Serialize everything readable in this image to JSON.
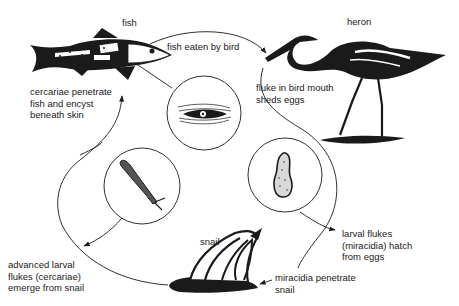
{
  "diagram": {
    "type": "life-cycle",
    "colors": {
      "ink": "#1a1a1a",
      "background": "#ffffff"
    },
    "hosts": {
      "fish": {
        "label": "fish"
      },
      "heron": {
        "label": "heron"
      },
      "snail": {
        "label": "snail"
      }
    },
    "stages": {
      "fish_eaten": "fish eaten by bird",
      "bird_mouth": "fluke in bird mouth\nsheds eggs",
      "miracidia_hatch": "larval flukes\n(miracidia) hatch\nfrom eggs",
      "miracidia_penetrate": "miracidia penetrate\nsnail",
      "cercariae_emerge": "advanced larval\nflukes (cercariae)\nemerge from snail",
      "cercariae_penetrate": "cercariae penetrate\nfish and encyst\nbeneath skin"
    },
    "insets": [
      {
        "name": "encysted-fluke",
        "depicts": "encysted fluke beneath fish skin"
      },
      {
        "name": "miracidium",
        "depicts": "larval fluke (miracidium)"
      },
      {
        "name": "cercaria",
        "depicts": "fork-tailed cercaria"
      }
    ]
  }
}
